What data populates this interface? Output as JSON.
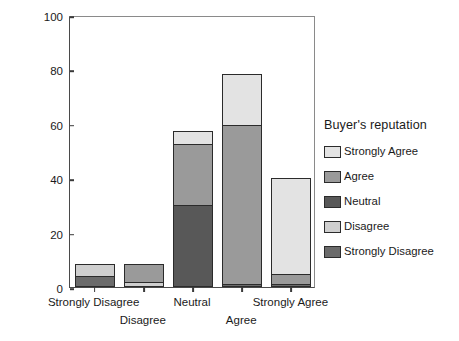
{
  "chart_data": {
    "type": "bar",
    "subtype": "stacked-bar",
    "title": "",
    "xlabel": "",
    "ylabel": "Count",
    "ylim": [
      0,
      100
    ],
    "yticks": [
      0,
      20,
      40,
      60,
      80,
      100
    ],
    "grid": false,
    "legend_position": "right",
    "legend_title": "Buyer's reputation",
    "categories": [
      "Strongly Disagree",
      "Disagree",
      "Neutral",
      "Agree",
      "Strongly Agree"
    ],
    "series": [
      {
        "name": "Strongly Disagree",
        "color": "#6b6b6b",
        "values": [
          4,
          0,
          0,
          1,
          1
        ]
      },
      {
        "name": "Disagree",
        "color": "#cfcfcf",
        "values": [
          5,
          2,
          0,
          0,
          0
        ]
      },
      {
        "name": "Neutral",
        "color": "#585858",
        "values": [
          0,
          0,
          30,
          0,
          0
        ]
      },
      {
        "name": "Agree",
        "color": "#9a9a9a",
        "values": [
          0,
          7,
          23,
          59,
          4
        ]
      },
      {
        "name": "Strongly Agree",
        "color": "#e3e3e3",
        "values": [
          0,
          0,
          5,
          19,
          36
        ]
      }
    ],
    "totals": [
      9,
      9,
      58,
      79,
      41
    ]
  },
  "axes": {
    "y_title": "Count",
    "y_tick_labels": [
      "0",
      "20",
      "40",
      "60",
      "80",
      "100"
    ],
    "x_tick_labels": [
      "Strongly Disagree",
      "Disagree",
      "Neutral",
      "Agree",
      "Strongly Agree"
    ]
  },
  "legend": {
    "title": "Buyer's reputation",
    "items": [
      {
        "label": "Strongly Agree",
        "color": "#e3e3e3"
      },
      {
        "label": "Agree",
        "color": "#9a9a9a"
      },
      {
        "label": "Neutral",
        "color": "#585858"
      },
      {
        "label": "Disagree",
        "color": "#cfcfcf"
      },
      {
        "label": "Strongly Disagree",
        "color": "#6b6b6b"
      }
    ]
  }
}
